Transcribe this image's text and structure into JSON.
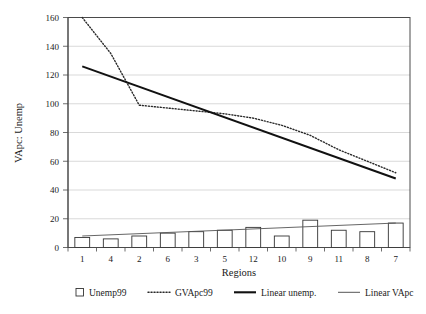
{
  "chart_data": {
    "type": "bar",
    "title": "",
    "xlabel": "Regions",
    "ylabel": "VApc: Unemp",
    "categories": [
      "1",
      "4",
      "2",
      "6",
      "3",
      "5",
      "12",
      "10",
      "9",
      "11",
      "8",
      "7"
    ],
    "ylim": [
      0,
      160
    ],
    "ytick_values": [
      "0",
      "20",
      "40",
      "60",
      "80",
      "100",
      "120",
      "140",
      "160"
    ],
    "grid": true,
    "legend_position": "bottom",
    "series": [
      {
        "name": "Unemp99",
        "type": "bar",
        "values": [
          7,
          6,
          8,
          10,
          11,
          12,
          14,
          8,
          19,
          12,
          11,
          17
        ]
      },
      {
        "name": "GVApc99",
        "type": "line",
        "style": "dotted",
        "values": [
          160,
          135,
          99,
          97,
          95,
          93,
          90,
          85,
          78,
          68,
          60,
          52
        ]
      },
      {
        "name": "Linear unemp.",
        "type": "trendline",
        "style": "thick-solid",
        "endpoints": [
          126,
          48
        ]
      },
      {
        "name": "Linear VApc",
        "type": "trendline",
        "style": "thin-solid",
        "endpoints": [
          8,
          17
        ]
      }
    ],
    "legend": [
      {
        "label": "Unemp99",
        "marker": "square-outline"
      },
      {
        "label": "GVApc99",
        "marker": "dotted-line"
      },
      {
        "label": "Linear unemp.",
        "marker": "thick-line"
      },
      {
        "label": "Linear VApc",
        "marker": "thin-line"
      }
    ]
  }
}
